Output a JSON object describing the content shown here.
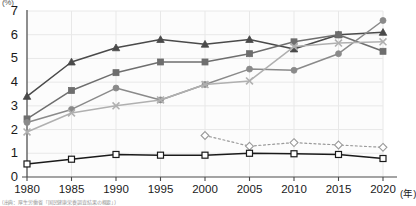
{
  "axes": {
    "y_unit": "(%)",
    "y_ticks": [
      0,
      1,
      2,
      3,
      4,
      5,
      6,
      7
    ],
    "y_min": 0,
    "y_max": 7,
    "x_unit": "(年)",
    "x_ticks": [
      "1980",
      "1985",
      "1990",
      "1995",
      "2000",
      "2005",
      "2010",
      "2015",
      "2020"
    ]
  },
  "footnote": "(出典：厚生労働省「国民健康栄養調査結果の概要」)",
  "colors": {
    "series1": "#4a4a4a",
    "series2": "#6e6e6e",
    "series3": "#8a8a8a",
    "series4": "#b0b0b0",
    "series5": "#9a9a9a",
    "series6": "#1a1a1a",
    "grid": "#e8e8e8",
    "axis": "#4a4a4a"
  },
  "chart_data": {
    "type": "line",
    "title": "",
    "subtitle": "",
    "xlabel": "(年)",
    "ylabel": "(%)",
    "xlim": [
      1980,
      2020
    ],
    "ylim": [
      0,
      7
    ],
    "grid": true,
    "legend_position": "none",
    "categories": [
      "1980",
      "1985",
      "1990",
      "1995",
      "2000",
      "2005",
      "2010",
      "2015",
      "2020"
    ],
    "x": [
      1980,
      1985,
      1990,
      1995,
      2000,
      2005,
      2010,
      2015,
      2020
    ],
    "series": [
      {
        "name": "series-triangle",
        "marker": "triangle",
        "line_style": "solid",
        "color": "#4a4a4a",
        "x": [
          1980,
          1985,
          1990,
          1995,
          2000,
          2005,
          2010,
          2015,
          2020
        ],
        "values": [
          3.4,
          4.85,
          5.45,
          5.8,
          5.6,
          5.8,
          5.4,
          6.0,
          6.1
        ]
      },
      {
        "name": "series-square-filled",
        "marker": "square",
        "line_style": "solid",
        "color": "#6e6e6e",
        "x": [
          1980,
          1985,
          1990,
          1995,
          2000,
          2005,
          2010,
          2015,
          2020
        ],
        "values": [
          2.45,
          3.65,
          4.4,
          4.85,
          4.85,
          5.2,
          5.7,
          6.0,
          5.3
        ]
      },
      {
        "name": "series-circle",
        "marker": "circle",
        "line_style": "solid",
        "color": "#8a8a8a",
        "x": [
          1980,
          1985,
          1990,
          1995,
          2000,
          2005,
          2010,
          2015,
          2020
        ],
        "values": [
          2.3,
          2.85,
          3.75,
          3.25,
          3.9,
          4.55,
          4.5,
          5.2,
          6.6
        ]
      },
      {
        "name": "series-cross",
        "marker": "x",
        "line_style": "solid",
        "color": "#b0b0b0",
        "x": [
          1980,
          1985,
          1990,
          1995,
          2000,
          2005,
          2010,
          2015,
          2020
        ],
        "values": [
          1.9,
          2.7,
          3.0,
          3.25,
          3.9,
          4.05,
          5.5,
          5.65,
          5.7
        ]
      },
      {
        "name": "series-diamond-open",
        "marker": "diamond",
        "line_style": "dotted",
        "color": "#9a9a9a",
        "x": [
          2000,
          2005,
          2010,
          2015,
          2020
        ],
        "values": [
          1.75,
          1.3,
          1.45,
          1.35,
          1.25
        ]
      },
      {
        "name": "series-square-open",
        "marker": "square-open",
        "line_style": "solid",
        "color": "#1a1a1a",
        "x": [
          1980,
          1985,
          1990,
          1995,
          2000,
          2005,
          2010,
          2015,
          2020
        ],
        "values": [
          0.55,
          0.75,
          0.95,
          0.92,
          0.92,
          1.0,
          0.98,
          0.95,
          0.78
        ]
      }
    ]
  }
}
